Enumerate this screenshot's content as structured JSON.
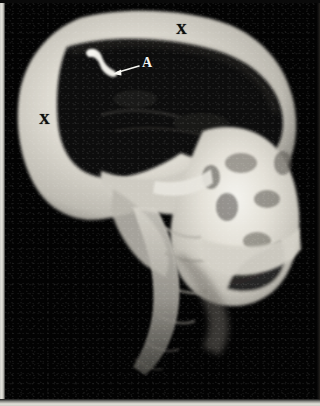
{
  "image": {
    "title": "Lateral skull radiograph",
    "modality": "X-ray",
    "view": "lateral",
    "background_color": "#030303",
    "bone_color": "#d8d5cc",
    "cavity_color": "#060606",
    "film_border_color": "#e3e1da"
  },
  "annotations": [
    {
      "id": "marker-x-superior",
      "label": "X",
      "color": "#0d0d0d",
      "x": 181,
      "y": 29,
      "description": "marker on superior calvarium"
    },
    {
      "id": "marker-x-posterior",
      "label": "X",
      "color": "#0d0d0d",
      "x": 44,
      "y": 119,
      "description": "marker on posterior calvarium"
    },
    {
      "id": "marker-a",
      "label": "A",
      "color": "#f2f2ee",
      "x": 142,
      "y": 63,
      "description": "label A with leader arrow to radiopaque structure"
    }
  ],
  "arrow": {
    "id": "leader-arrow-a",
    "color": "#f5f5f0",
    "tail_x": 139,
    "tail_y": 66,
    "head_x": 114,
    "head_y": 73,
    "stroke_width": 1.6
  },
  "anatomy": [
    {
      "name": "calvarium",
      "label": "cranial vault"
    },
    {
      "name": "cranial-cavity",
      "label": "cranial cavity"
    },
    {
      "name": "facial-bones",
      "label": "facial skeleton"
    },
    {
      "name": "skull-base",
      "label": "skull base"
    },
    {
      "name": "cervical-spine",
      "label": "cervical spine"
    },
    {
      "name": "radiopaque-focus",
      "label": "radiopaque focus"
    }
  ]
}
